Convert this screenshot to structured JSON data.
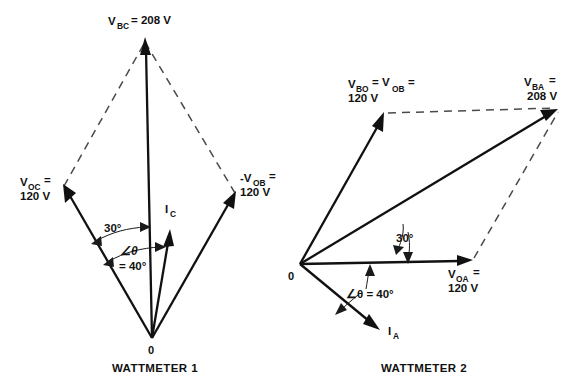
{
  "figure": {
    "type": "phasor-diagram-pair",
    "background_color": "#ffffff",
    "line_color": "#111111",
    "dashed_color": "#4a4a4a"
  },
  "wattmeter1": {
    "caption": "WATTMETER 1",
    "origin_label": "0",
    "phasors": [
      {
        "name": "V_BC",
        "label_main": "V",
        "label_sub": "BC",
        "label_tail": "= 208 V",
        "magnitude": "208 V",
        "style": "solid",
        "direction_deg": 92
      },
      {
        "name": "V_OC",
        "label_main": "V",
        "label_sub": "OC",
        "label_tail": "=",
        "label_line2": "120 V",
        "magnitude": "120 V",
        "style": "solid",
        "direction_deg": 121
      },
      {
        "name": "-V_OB",
        "label_main": "-V",
        "label_sub": "OB",
        "label_tail": "=",
        "label_line2": "120 V",
        "magnitude": "120 V",
        "style": "solid",
        "direction_deg": 61
      },
      {
        "name": "I_C",
        "label_main": "I",
        "label_sub": "C",
        "label_tail": "",
        "style": "solid-current"
      }
    ],
    "angles": [
      {
        "name": "angle-30",
        "text": "30°"
      },
      {
        "name": "angle-theta",
        "text_line1": "∠θ",
        "text_line2": "= 40°",
        "value": "40°"
      }
    ]
  },
  "wattmeter2": {
    "caption": "WATTMETER 2",
    "origin_label": "0",
    "phasors": [
      {
        "name": "V_BO",
        "label_main": "V",
        "label_sub": "BO",
        "label_mid": "= V",
        "label_sub2": "OB",
        "label_tail": "=",
        "label_line2": "120 V",
        "magnitude": "120 V",
        "style": "solid"
      },
      {
        "name": "V_BA",
        "label_main": "V",
        "label_sub": "BA",
        "label_tail": "=",
        "label_line2": "208 V",
        "magnitude": "208 V",
        "style": "solid"
      },
      {
        "name": "V_OA",
        "label_main": "V",
        "label_sub": "OA",
        "label_tail": "=",
        "label_line2": "120 V",
        "magnitude": "120 V",
        "style": "solid"
      },
      {
        "name": "I_A",
        "label_main": "I",
        "label_sub": "A",
        "label_tail": "",
        "style": "solid-current"
      }
    ],
    "angles": [
      {
        "name": "angle-30",
        "text": "30°"
      },
      {
        "name": "angle-theta",
        "text": "∠θ = 40°",
        "value": "40°"
      }
    ]
  }
}
